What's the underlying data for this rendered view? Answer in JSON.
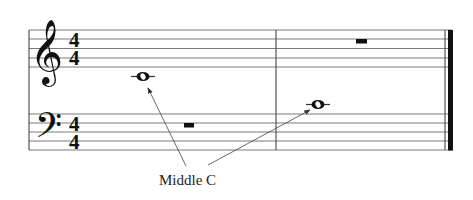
{
  "diagram": {
    "label": "Middle C",
    "treble_staff": {
      "clef": "treble-clef",
      "time_signature": {
        "top": "4",
        "bottom": "4"
      },
      "measures": [
        {
          "content": "whole note, Middle C (ledger line below staff)"
        },
        {
          "content": "whole rest"
        }
      ]
    },
    "bass_staff": {
      "clef": "bass-clef",
      "time_signature": {
        "top": "4",
        "bottom": "4"
      },
      "measures": [
        {
          "content": "whole rest"
        },
        {
          "content": "whole note, Middle C (ledger line above staff)"
        }
      ]
    },
    "annotations": [
      {
        "text": "Middle C",
        "points_to": [
          "treble measure 1 note",
          "bass measure 2 note"
        ]
      }
    ],
    "colors": {
      "staff_lines": "#7a7a7a",
      "ink": "#111111",
      "background": "#ffffff"
    }
  }
}
